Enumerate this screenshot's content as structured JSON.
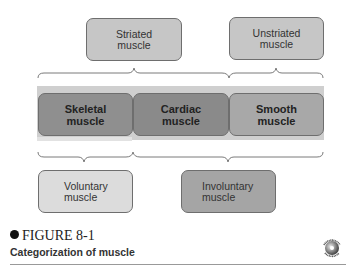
{
  "diagram": {
    "title": "Categorization of muscle",
    "figure_label": "FIGURE 8-1",
    "top_categories": [
      {
        "label": "Striated\nmuscle"
      },
      {
        "label": "Unstriated\nmuscle"
      }
    ],
    "muscle_types": [
      {
        "label": "Skeletal\nmuscle"
      },
      {
        "label": "Cardiac\nmuscle"
      },
      {
        "label": "Smooth\nmuscle"
      }
    ],
    "bottom_categories": [
      {
        "label": "Voluntary\nmuscle"
      },
      {
        "label": "Involuntary\nmuscle"
      }
    ],
    "badge": {
      "top_text": "PhysioEdge",
      "bottom_text": "Activity"
    }
  }
}
